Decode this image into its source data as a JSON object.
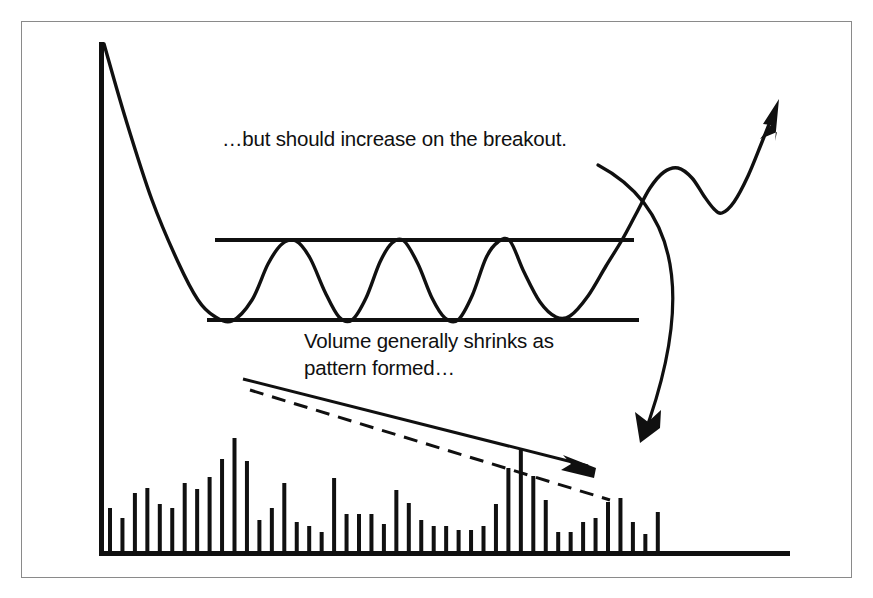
{
  "figure": {
    "title_visible": false,
    "background_color": "#ffffff",
    "ink_color": "#101010",
    "frame_color": "#8a8a8a",
    "frame": {
      "x": 21,
      "y": 21,
      "width": 831,
      "height": 557
    }
  },
  "annotations": [
    {
      "id": "breakout-note",
      "text": "…but should increase on the breakout.",
      "x": 222,
      "y": 146,
      "anchor": "start",
      "pointer": "curved-arrow-down-to-volume-spike"
    },
    {
      "id": "volume-note-line1",
      "text": "Volume generally shrinks as",
      "x": 304,
      "y": 348,
      "anchor": "start",
      "pointer": "none"
    },
    {
      "id": "volume-note-line2",
      "text": "pattern formed…",
      "x": 304,
      "y": 375,
      "anchor": "start",
      "pointer": "none"
    }
  ],
  "chart_data": {
    "type": "line",
    "xlabel": "",
    "ylabel": "",
    "grid": false,
    "legend": "none",
    "axes": {
      "y_axis": {
        "x": 99,
        "y_top": 42,
        "y_bottom": 556,
        "width": 5
      },
      "x_axis": {
        "y": 556,
        "x_left": 99,
        "x_right": 790,
        "height": 5
      }
    },
    "series": [
      {
        "name": "price",
        "description": "Downtrend into a rectangle consolidation, five swings between support and resistance, then an upside breakout with pullback and continuation higher.",
        "points": [
          [
            104,
            44
          ],
          [
            126,
            120
          ],
          [
            152,
            200
          ],
          [
            178,
            262
          ],
          [
            198,
            300
          ],
          [
            214,
            316
          ],
          [
            232,
            321
          ],
          [
            252,
            300
          ],
          [
            268,
            264
          ],
          [
            282,
            244
          ],
          [
            296,
            241
          ],
          [
            310,
            258
          ],
          [
            325,
            292
          ],
          [
            339,
            317
          ],
          [
            352,
            320
          ],
          [
            366,
            298
          ],
          [
            380,
            262
          ],
          [
            392,
            243
          ],
          [
            404,
            241
          ],
          [
            418,
            264
          ],
          [
            432,
            298
          ],
          [
            445,
            318
          ],
          [
            458,
            320
          ],
          [
            472,
            296
          ],
          [
            486,
            258
          ],
          [
            498,
            242
          ],
          [
            510,
            241
          ],
          [
            524,
            272
          ],
          [
            540,
            302
          ],
          [
            556,
            317
          ],
          [
            570,
            316
          ],
          [
            588,
            296
          ],
          [
            606,
            266
          ],
          [
            622,
            240
          ],
          [
            636,
            214
          ],
          [
            650,
            188
          ],
          [
            664,
            172
          ],
          [
            678,
            168
          ],
          [
            692,
            178
          ],
          [
            704,
            196
          ],
          [
            714,
            209
          ],
          [
            722,
            213
          ],
          [
            734,
            202
          ],
          [
            748,
            176
          ],
          [
            762,
            142
          ],
          [
            774,
            112
          ]
        ]
      },
      {
        "name": "price-breakout-arrowhead",
        "description": "Arrow head at the end of the rising breakout line",
        "tip": [
          779,
          99
        ]
      }
    ],
    "reference_lines": [
      {
        "name": "resistance",
        "style": "solid",
        "x1": 215,
        "y1": 240,
        "x2": 634,
        "y2": 240,
        "width": 4
      },
      {
        "name": "support",
        "style": "solid",
        "x1": 207,
        "y1": 320,
        "x2": 639,
        "y2": 320,
        "width": 4
      },
      {
        "name": "volume-downtrend-solid",
        "style": "solid",
        "x1": 243,
        "y1": 379,
        "x2": 588,
        "y2": 466,
        "width": 3,
        "arrow": "end"
      },
      {
        "name": "volume-downtrend-dashed",
        "style": "dashed",
        "x1": 250,
        "y1": 390,
        "x2": 610,
        "y2": 500,
        "width": 3,
        "dash": "14 9"
      }
    ],
    "volume": {
      "type": "bar",
      "baseline_y": 556,
      "bar_width": 4,
      "x_start": 110,
      "x_step": 12.45,
      "note": "Bar heights in pixels above the baseline, left to right",
      "heights": [
        48,
        38,
        63,
        68,
        52,
        48,
        73,
        67,
        79,
        97,
        118,
        95,
        36,
        48,
        73,
        34,
        30,
        24,
        78,
        42,
        42,
        42,
        32,
        66,
        53,
        36,
        30,
        30,
        26,
        26,
        30,
        52,
        88,
        106,
        80,
        56,
        24,
        24,
        34,
        38,
        54,
        58,
        34,
        22,
        44
      ],
      "spike_index": 33,
      "spike_label": "breakout volume spike"
    },
    "annotation_arrow": {
      "name": "breakout-callout-arrow",
      "style": "curved",
      "from": [
        598,
        165
      ],
      "control": [
        720,
        230
      ],
      "to": [
        643,
        438
      ],
      "arrowhead": "end"
    }
  }
}
